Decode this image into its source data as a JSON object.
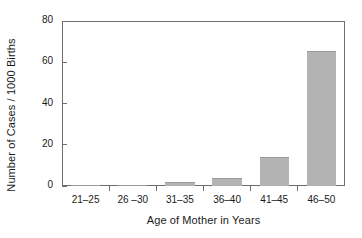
{
  "chart_data": {
    "type": "bar",
    "title": "",
    "xlabel": "Age of Mother in Years",
    "ylabel": "Number of Cases / 1000 Births",
    "categories": [
      "21–25",
      "26 –30",
      "31–35",
      "36–40",
      "41–45",
      "46–50"
    ],
    "values": [
      0.5,
      0.5,
      2,
      4,
      14,
      65.5
    ],
    "ylim": [
      0,
      80
    ],
    "yticks": [
      0,
      20,
      40,
      60,
      80
    ],
    "ytick_labels": [
      "0",
      "20",
      "40",
      "60",
      "80"
    ],
    "grid": false,
    "legend": "none",
    "bar_color": "#b3b3b3",
    "axis_color": "#6e6e6e",
    "text_color": "#1a1a1a",
    "background": "#ffffff"
  }
}
